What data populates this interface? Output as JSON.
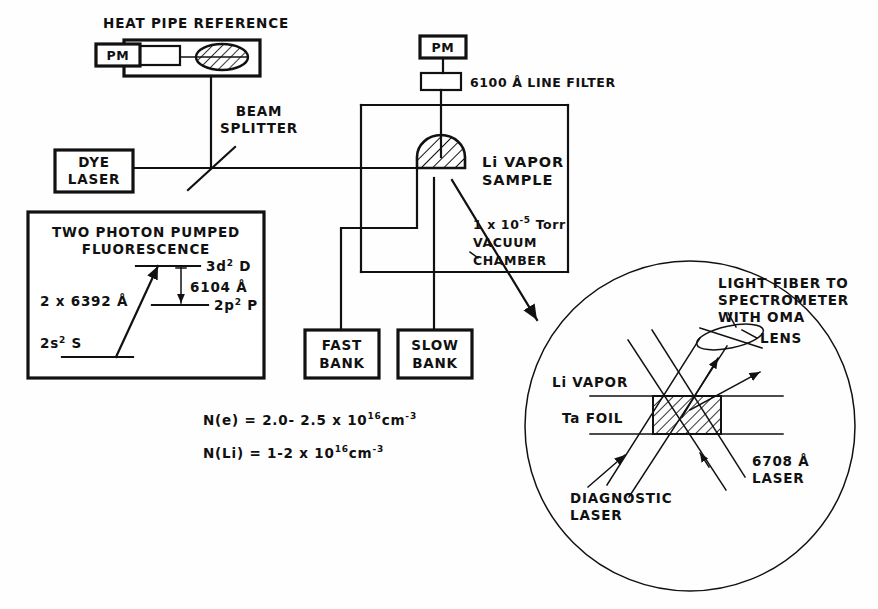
{
  "figure": {
    "type": "schematic-diagram",
    "line_color": "#111111",
    "background_color": "#ffffff"
  },
  "heat_pipe": {
    "title": "HEAT PIPE REFERENCE",
    "pm_label": "PM"
  },
  "detector": {
    "pm_label": "PM",
    "filter_label": "6100 Å LINE FILTER"
  },
  "beam_splitter": {
    "line1": "BEAM",
    "line2": "SPLITTER"
  },
  "dye_laser": {
    "line1": "DYE",
    "line2": "LASER"
  },
  "chamber": {
    "sample_line1": "Li VAPOR",
    "sample_line2": "SAMPLE",
    "pressure_prefix": "1 x 10",
    "pressure_exponent": "-5",
    "pressure_unit": "Torr",
    "vacuum_line1": "VACUUM",
    "vacuum_line2": "CHAMBER"
  },
  "banks": [
    {
      "line1": "FAST",
      "line2": "BANK"
    },
    {
      "line1": "SLOW",
      "line2": "BANK"
    }
  ],
  "energy_inset": {
    "title_line1": "TWO PHOTON PUMPED",
    "title_line2": "FLUORESCENCE",
    "pump_label": "2 x 6392 Å",
    "emission_label": "6104 Å",
    "levels": [
      {
        "name": "3d",
        "superscript": "2",
        "term": "D"
      },
      {
        "name": "2p",
        "superscript": "2",
        "term": "P"
      },
      {
        "name": "2s",
        "superscript": "2",
        "term": "S"
      }
    ]
  },
  "densities": [
    {
      "species": "N(e)",
      "equals": "=",
      "value": "2.0- 2.5 x 10",
      "exponent": "16",
      "unit": "cm",
      "unit_exponent": "-3"
    },
    {
      "species": "N(Li)",
      "equals": "=",
      "value": "1-2 x 10",
      "exponent": "16",
      "unit": "cm",
      "unit_exponent": "-3"
    }
  ],
  "detail_inset": {
    "fiber_line1": "LIGHT FIBER TO",
    "fiber_line2": "SPECTROMETER",
    "fiber_line3": "WITH  OMA",
    "lens_label": "LENS",
    "li_vapor_label": "Li VAPOR",
    "ta_foil_label": "Ta  FOIL",
    "diagnostic_line1": "DIAGNOSTIC",
    "diagnostic_line2": "LASER",
    "probe_laser_line1": "6708 Å",
    "probe_laser_line2": "LASER"
  }
}
